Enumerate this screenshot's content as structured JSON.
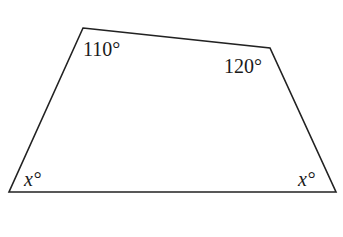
{
  "diagram": {
    "type": "quadrilateral",
    "vertices": {
      "top_left": [
        83,
        28
      ],
      "top_right": [
        270,
        48
      ],
      "bottom_right": [
        336,
        192
      ],
      "bottom_left": [
        9,
        192
      ]
    },
    "stroke_color": "#222222",
    "angles": {
      "top_left": "110°",
      "top_right": "120°",
      "bottom_left": "x°",
      "bottom_right": "x°"
    },
    "angle_parts": {
      "bottom_left_var": "x",
      "bottom_right_var": "x",
      "degree": "°"
    }
  }
}
